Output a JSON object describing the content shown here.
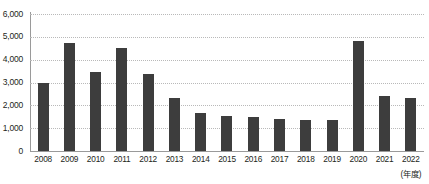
{
  "chart_data": {
    "type": "bar",
    "title": "",
    "subtitle": "",
    "xlabel": "(年度)",
    "ylabel": "",
    "ylim": [
      0,
      6000
    ],
    "ytick_step": 1000,
    "grid": true,
    "legend": null,
    "bar_color": "#3d3d3d",
    "axis_color": "#9a9a9a",
    "grid_color": "#b9b9b9",
    "text_color": "#231f20",
    "ytick_labels": [
      "6,000",
      "5,000",
      "4,000",
      "3,000",
      "2,000",
      "1,000",
      "0"
    ],
    "ytick_values": [
      6000,
      5000,
      4000,
      3000,
      2000,
      1000,
      0
    ],
    "categories": [
      "2008",
      "2009",
      "2010",
      "2011",
      "2012",
      "2013",
      "2014",
      "2015",
      "2016",
      "2017",
      "2018",
      "2019",
      "2020",
      "2021",
      "2022"
    ],
    "values": [
      3000,
      4750,
      3450,
      4500,
      3380,
      2330,
      1650,
      1520,
      1480,
      1400,
      1350,
      1370,
      4800,
      2400,
      2300
    ]
  }
}
